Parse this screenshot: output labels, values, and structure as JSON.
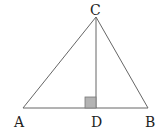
{
  "diagram": {
    "type": "triangle-with-altitude",
    "points": {
      "A": {
        "label": "A",
        "x": 23,
        "y": 108
      },
      "B": {
        "label": "B",
        "x": 148,
        "y": 108
      },
      "C": {
        "label": "C",
        "x": 96,
        "y": 17
      },
      "D": {
        "label": "D",
        "x": 96,
        "y": 108
      }
    },
    "segments": [
      "AB",
      "AC",
      "BC",
      "CD"
    ],
    "right_angle_marker": {
      "at": "D",
      "size": 11,
      "fill": "#b3b3b3"
    },
    "colors": {
      "line": "#555555",
      "label": "#222222"
    }
  }
}
